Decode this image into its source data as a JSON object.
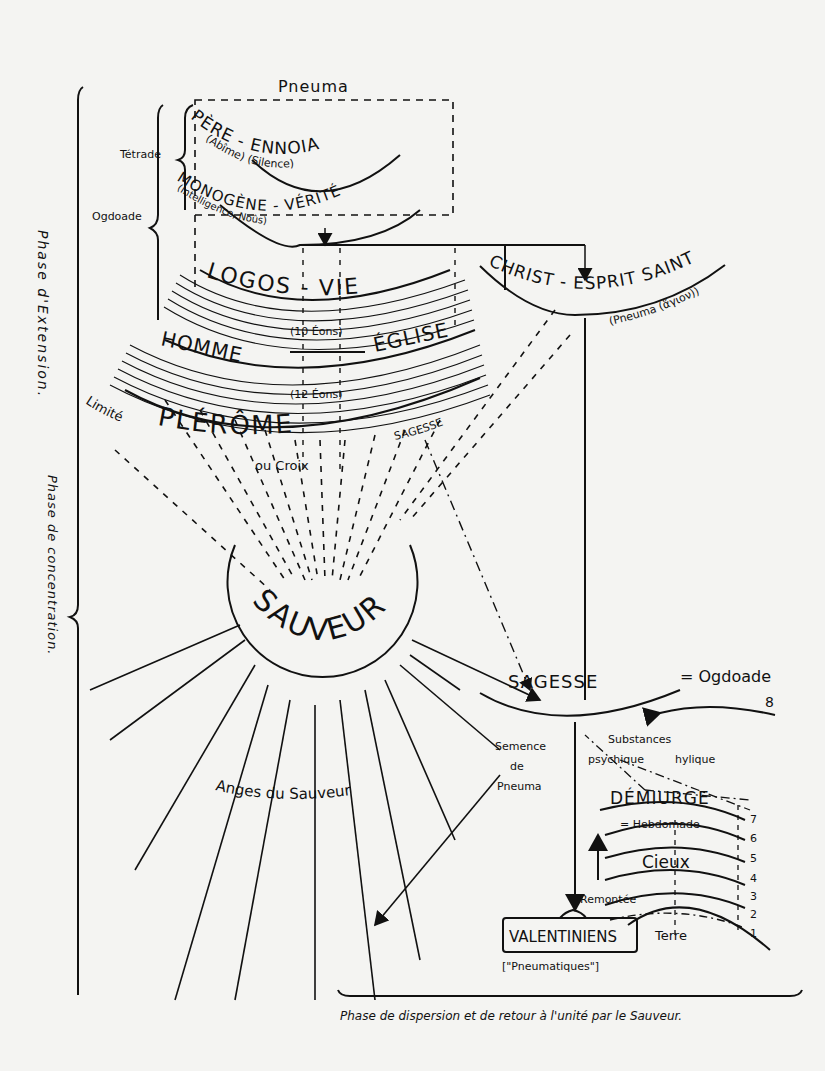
{
  "diagram": {
    "top": {
      "pneuma": "Pneuma",
      "tetrade": "Tétrade",
      "ogdoade": "Ogdoade",
      "pere_ennoia": "PÈRE - ENNOIA",
      "abime_silence": "(Abîme) (Silence)",
      "monogene_verite": "MONOGÈNE - VÉRITÉ",
      "intelligence_nous": "(Intelligence, Noûs)"
    },
    "aeons": {
      "logos_vie": "LOGOS - VIE",
      "ten_eons": "(10 Éons)",
      "homme": "HOMME",
      "eglise": "ÉGLISE",
      "twelve_eons": "(12 Éons)",
      "plerome": "PLÉRÔME",
      "sagesse_small": "SAGESSE",
      "limite": "Limité",
      "ou_croix": "ou Croix"
    },
    "christ": {
      "label": "CHRIST - ESPRIT SAINT",
      "pneuma_hagion": "(Pneuma (ἅγιον))"
    },
    "side_labels": {
      "phase_extension": "Phase d'Extension.",
      "phase_concentration": "Phase de concentration."
    },
    "sauveur": {
      "label": "SAUVEUR",
      "anges": "Anges du Sauveur"
    },
    "sagesse": {
      "label": "SAGESSE",
      "equals_ogdoade": "= Ogdoade",
      "eight": "8",
      "semence": [
        "Semence",
        "de",
        "Pneuma"
      ],
      "substances": "Substances",
      "psychique": "psychique",
      "hylique": "hylique"
    },
    "demiurge": {
      "label": "DÉMIURGE",
      "hebdomade": "= Hebdomade",
      "cieux": "Cieux",
      "remontee": "Remontée",
      "terre": "Terre",
      "levels": [
        "7",
        "6",
        "5",
        "4",
        "3",
        "2",
        "1"
      ]
    },
    "valentiniens": {
      "label": "VALENTINIENS",
      "pneumatiques": "[\"Pneumatiques\"]"
    },
    "bottom_caption": "Phase de dispersion et de retour à l'unité par le Sauveur."
  }
}
